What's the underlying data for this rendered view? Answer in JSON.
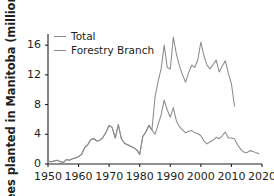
{
  "chart_data": {
    "type": "line",
    "title": "",
    "xlabel": "",
    "ylabel": "Trees planted in Manitoba (millions)",
    "xlim": [
      1950,
      2020
    ],
    "ylim": [
      0,
      17.5
    ],
    "xticks": [
      1950,
      1960,
      1970,
      1980,
      1990,
      2000,
      2010,
      2020
    ],
    "yticks": [
      0,
      4,
      8,
      12,
      16
    ],
    "grid": false,
    "legend_position": "top-left",
    "series": [
      {
        "name": "Total",
        "color": "#8c8c8c",
        "x": [
          1950,
          1951,
          1952,
          1953,
          1954,
          1955,
          1956,
          1957,
          1958,
          1959,
          1960,
          1961,
          1962,
          1963,
          1964,
          1965,
          1966,
          1967,
          1968,
          1969,
          1970,
          1971,
          1972,
          1973,
          1974,
          1975,
          1976,
          1977,
          1978,
          1979,
          1980,
          1981,
          1982,
          1983,
          1984,
          1985,
          1986,
          1987,
          1988,
          1989,
          1990,
          1991,
          1992,
          1993,
          1994,
          1995,
          1996,
          1997,
          1998,
          1999,
          2000,
          2001,
          2002,
          2003,
          2004,
          2005,
          2006,
          2007,
          2008,
          2009,
          2010,
          2011
        ],
        "values": [
          0.4,
          0.3,
          0.4,
          0.5,
          0.3,
          0.2,
          0.6,
          0.5,
          0.7,
          0.8,
          1.0,
          1.3,
          2.2,
          2.6,
          3.3,
          3.4,
          3.1,
          3.2,
          3.6,
          4.3,
          5.2,
          4.9,
          3.5,
          5.3,
          3.4,
          2.8,
          2.6,
          2.4,
          2.2,
          1.9,
          1.3,
          3.7,
          4.3,
          5.2,
          4.6,
          9.0,
          11.1,
          12.8,
          16.0,
          13.0,
          12.8,
          17.1,
          14.8,
          13.2,
          12.0,
          11.0,
          12.3,
          13.3,
          13.0,
          14.0,
          16.4,
          14.6,
          13.3,
          12.8,
          13.4,
          14.0,
          12.4,
          13.2,
          13.9,
          12.2,
          10.8,
          7.8
        ]
      },
      {
        "name": "Forestry Branch",
        "color": "#8c8c8c",
        "x": [
          1950,
          1951,
          1952,
          1953,
          1954,
          1955,
          1956,
          1957,
          1958,
          1959,
          1960,
          1961,
          1962,
          1963,
          1964,
          1965,
          1966,
          1967,
          1968,
          1969,
          1970,
          1971,
          1972,
          1973,
          1974,
          1975,
          1976,
          1977,
          1978,
          1979,
          1980,
          1981,
          1982,
          1983,
          1984,
          1985,
          1986,
          1987,
          1988,
          1989,
          1990,
          1991,
          1992,
          1993,
          1994,
          1995,
          1996,
          1997,
          1998,
          1999,
          2000,
          2001,
          2002,
          2003,
          2004,
          2005,
          2006,
          2007,
          2008,
          2009,
          2010,
          2011,
          2012,
          2013,
          2014,
          2015,
          2016,
          2017,
          2018,
          2019
        ],
        "values": [
          0.4,
          0.3,
          0.4,
          0.5,
          0.3,
          0.2,
          0.6,
          0.5,
          0.7,
          0.8,
          1.0,
          1.3,
          2.2,
          2.6,
          3.3,
          3.4,
          3.1,
          3.2,
          3.6,
          4.3,
          5.2,
          4.9,
          3.5,
          5.3,
          3.4,
          2.8,
          2.6,
          2.4,
          2.2,
          1.9,
          1.3,
          3.7,
          4.3,
          5.2,
          4.6,
          4.0,
          5.3,
          6.6,
          8.6,
          7.3,
          6.3,
          7.6,
          5.8,
          5.0,
          4.6,
          4.2,
          4.4,
          4.5,
          4.2,
          4.1,
          3.8,
          3.1,
          2.7,
          3.0,
          3.2,
          3.6,
          3.4,
          3.8,
          4.3,
          3.5,
          3.5,
          3.4,
          2.6,
          2.0,
          1.6,
          1.5,
          1.8,
          1.7,
          1.5,
          1.4
        ]
      }
    ]
  },
  "axes": {
    "y_title": "Trees planted in Manitoba (millions)",
    "y_tick_labels": [
      "16",
      "12",
      "8",
      "4",
      "0"
    ],
    "x_tick_labels": [
      "1950",
      "1960",
      "1970",
      "1980",
      "1990",
      "2000",
      "2010",
      "2020"
    ]
  },
  "legend": {
    "entries": [
      {
        "label": "Total"
      },
      {
        "label": "Forestry Branch"
      }
    ]
  },
  "colors": {
    "line": "#8c8c8c",
    "axis": "#231f20",
    "text": "#231f20",
    "background": "#ffffff"
  }
}
